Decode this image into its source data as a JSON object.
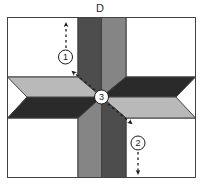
{
  "figure": {
    "name": "lemoyne-star-quilt-block-diagram",
    "background_color": "#ffffff",
    "block_label": "D",
    "outline_color": "#404040",
    "square": {
      "x": 7,
      "y": 17,
      "width": 189,
      "height": 161
    }
  },
  "colors": {
    "background_white": "#ffffff",
    "light_gray": "#b9b9b9",
    "medium_gray": "#858585",
    "dark_gray": "#4d4d4d",
    "very_dark_gray": "#2a2a2a",
    "outline": "#404040",
    "arrow": "#1a1a1a"
  },
  "star": {
    "center": {
      "x": 101.5,
      "y": 97
    },
    "points": [
      {
        "name": "diamond-top-left",
        "shade": "dark_gray",
        "color": "#4d4d4d"
      },
      {
        "name": "diamond-top-right",
        "shade": "medium_gray",
        "color": "#858585"
      },
      {
        "name": "diamond-right-upper",
        "shade": "very_dark_gray",
        "color": "#2a2a2a"
      },
      {
        "name": "diamond-right-lower",
        "shade": "light_gray",
        "color": "#b9b9b9"
      },
      {
        "name": "diamond-bottom-right",
        "shade": "dark_gray",
        "color": "#4d4d4d"
      },
      {
        "name": "diamond-bottom-left",
        "shade": "medium_gray",
        "color": "#858585"
      },
      {
        "name": "diamond-left-lower",
        "shade": "very_dark_gray",
        "color": "#2a2a2a"
      },
      {
        "name": "diamond-left-upper",
        "shade": "light_gray",
        "color": "#b9b9b9"
      }
    ]
  },
  "corner_squares": [
    {
      "name": "corner-top-left",
      "color": "#ffffff"
    },
    {
      "name": "corner-top-right",
      "color": "#ffffff"
    },
    {
      "name": "corner-bottom-left",
      "color": "#ffffff"
    },
    {
      "name": "corner-bottom-right",
      "color": "#ffffff"
    }
  ],
  "annotations": [
    {
      "name": "arrow-1",
      "marker": "1",
      "label_x": 65,
      "label_y": 56,
      "direction": "up",
      "description": "dashed arrow pointing up along the vertical seam"
    },
    {
      "name": "arrow-2",
      "marker": "2",
      "label_x": 138,
      "label_y": 143,
      "direction": "down",
      "description": "dashed arrow pointing down along the vertical seam"
    },
    {
      "name": "arrow-3",
      "marker": "3",
      "label_x": 101,
      "label_y": 97,
      "direction": "diagonal-both",
      "description": "double-headed dashed arrow along the diagonal seam through the star center"
    }
  ]
}
